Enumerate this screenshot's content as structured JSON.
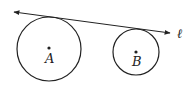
{
  "diagram": {
    "title": "",
    "circles": [
      {
        "label": "A",
        "cx": 49,
        "cy": 49,
        "r": 32
      },
      {
        "label": "B",
        "cx": 136,
        "cy": 52,
        "r": 23
      }
    ],
    "line": {
      "label": "ℓ",
      "x1": 14,
      "y1": 12,
      "x2": 170,
      "y2": 33,
      "arrows": "both"
    },
    "colors": {
      "stroke": "#222222",
      "background": "#ffffff"
    }
  }
}
